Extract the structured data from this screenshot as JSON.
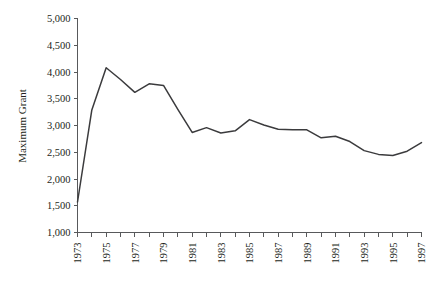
{
  "chart_data": {
    "type": "line",
    "title": "",
    "xlabel": "",
    "ylabel": "Maximum Grant",
    "ylim": [
      1000,
      5000
    ],
    "xlim": [
      1973,
      1997
    ],
    "grid": false,
    "legend": null,
    "y_ticks": [
      "1,000",
      "1,500",
      "2,000",
      "2,500",
      "3,000",
      "3,500",
      "4,000",
      "4,500",
      "5,000"
    ],
    "y_tick_values": [
      1000,
      1500,
      2000,
      2500,
      3000,
      3500,
      4000,
      4500,
      5000
    ],
    "x_ticks_all": [
      1973,
      1974,
      1975,
      1976,
      1977,
      1978,
      1979,
      1980,
      1981,
      1982,
      1983,
      1984,
      1985,
      1986,
      1987,
      1988,
      1989,
      1990,
      1991,
      1992,
      1993,
      1994,
      1995,
      1996,
      1997
    ],
    "x_tick_labels": [
      "1973",
      "1975",
      "1977",
      "1979",
      "1981",
      "1983",
      "1985",
      "1987",
      "1989",
      "1991",
      "1993",
      "1995",
      "1997"
    ],
    "x_tick_label_values": [
      1973,
      1975,
      1977,
      1979,
      1981,
      1983,
      1985,
      1987,
      1989,
      1991,
      1993,
      1995,
      1997
    ],
    "series": [
      {
        "name": "Maximum Grant",
        "color": "#3b3b3d",
        "x": [
          1973,
          1974,
          1975,
          1976,
          1977,
          1978,
          1979,
          1980,
          1981,
          1982,
          1983,
          1984,
          1985,
          1986,
          1987,
          1988,
          1989,
          1990,
          1991,
          1992,
          1993,
          1994,
          1995,
          1996,
          1997
        ],
        "values": [
          1570,
          3290,
          4080,
          3860,
          3620,
          3780,
          3750,
          3300,
          2870,
          2960,
          2860,
          2900,
          3110,
          3010,
          2930,
          2920,
          2920,
          2770,
          2800,
          2700,
          2530,
          2460,
          2440,
          2520,
          2680
        ]
      }
    ]
  },
  "axis": {
    "y_label": "Maximum Grant"
  },
  "colors": {
    "line": "#3b3b3d",
    "axis": "#58595b",
    "text": "#231f20",
    "background": "#ffffff"
  }
}
